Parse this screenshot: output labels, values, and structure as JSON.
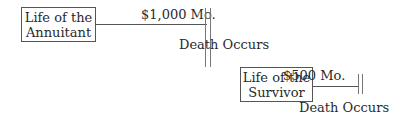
{
  "diagram": {
    "annuitant_box": {
      "line1": "Life of the",
      "line2": "Annuitant"
    },
    "annuitant_payment": "$1,000 Mo.",
    "first_event": "Death Occurs",
    "survivor_box": {
      "line1": "Life of the",
      "line2": "Survivor"
    },
    "survivor_payment": "$500 Mo.",
    "second_event": "Death Occurs"
  }
}
